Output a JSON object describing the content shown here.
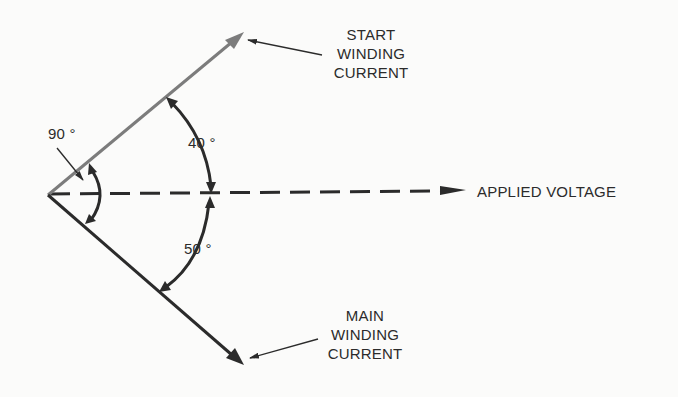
{
  "diagram": {
    "type": "phasor-diagram",
    "vectors": [
      {
        "id": "start_winding_current",
        "label_lines": [
          "START",
          "WINDING",
          "CURRENT"
        ],
        "angle_from_voltage_deg": 40,
        "direction": "leading",
        "color": "#7a7a7a"
      },
      {
        "id": "applied_voltage",
        "label": "APPLIED VOLTAGE",
        "style": "dashed",
        "color": "#2b2b2b"
      },
      {
        "id": "main_winding_current",
        "label_lines": [
          "MAIN",
          "WINDING",
          "CURRENT"
        ],
        "angle_from_voltage_deg": 50,
        "direction": "lagging",
        "color": "#2b2b2b"
      }
    ],
    "angles": {
      "between_currents": "90 °",
      "start_to_voltage": "40 °",
      "voltage_to_main": "50 °"
    }
  },
  "labels": {
    "start": {
      "l1": "START",
      "l2": "WINDING",
      "l3": "CURRENT"
    },
    "main": {
      "l1": "MAIN",
      "l2": "WINDING",
      "l3": "CURRENT"
    },
    "voltage": "APPLIED VOLTAGE",
    "angle90": "90 °",
    "angle40": "40 °",
    "angle50": "50 °"
  }
}
